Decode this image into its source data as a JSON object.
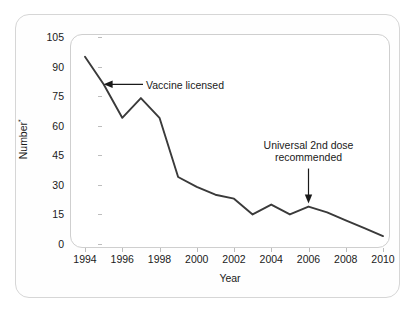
{
  "figure": {
    "yaxis_label": "Number",
    "yaxis_label_suffix": "*",
    "xaxis_label": "Year"
  },
  "annotations": {
    "vaccine_licensed": "Vaccine licensed",
    "universal_dose_line1": "Universal 2nd dose",
    "universal_dose_line2": "recommended"
  },
  "chart_data": {
    "type": "line",
    "title": "",
    "subtitle": "",
    "xlabel": "Year",
    "ylabel": "Number*",
    "xlim": [
      1994,
      2010
    ],
    "ylim": [
      0,
      105
    ],
    "ytick_labels": [
      "0",
      "15",
      "30",
      "45",
      "60",
      "75",
      "90",
      "105"
    ],
    "ytick_values": [
      0,
      15,
      30,
      45,
      60,
      75,
      90,
      105
    ],
    "xtick_labels": [
      "1994",
      "1996",
      "1998",
      "2000",
      "2002",
      "2004",
      "2006",
      "2008",
      "2010"
    ],
    "xtick_values": [
      1994,
      1996,
      1998,
      2000,
      2002,
      2004,
      2006,
      2008,
      2010
    ],
    "grid": false,
    "legend": "none",
    "line_color": "#3a3a3a",
    "x": [
      1994,
      1995,
      1996,
      1997,
      1998,
      1999,
      2000,
      2001,
      2002,
      2003,
      2004,
      2005,
      2006,
      2007,
      2008,
      2009,
      2010
    ],
    "values": [
      95,
      81,
      64,
      74,
      64,
      34,
      29,
      25,
      23,
      15,
      20,
      15,
      19,
      16,
      12,
      8,
      4
    ],
    "series": [
      {
        "name": "Number",
        "values": [
          95,
          81,
          64,
          74,
          64,
          34,
          29,
          25,
          23,
          15,
          20,
          15,
          19,
          16,
          12,
          8,
          4
        ]
      }
    ],
    "annotations": [
      {
        "text": "Vaccine licensed",
        "target_x": 1995,
        "target_y": 81,
        "arrow": "left"
      },
      {
        "text": "Universal 2nd dose recommended",
        "target_x": 2006,
        "target_y": 19,
        "arrow": "down"
      }
    ]
  }
}
